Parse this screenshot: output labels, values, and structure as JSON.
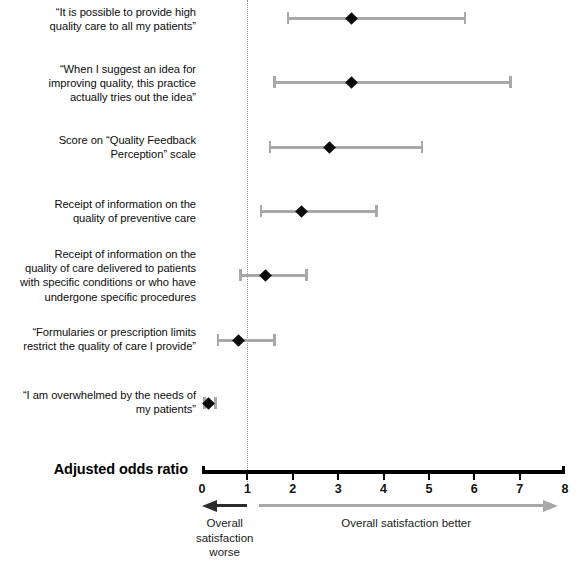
{
  "figure": {
    "width": 578,
    "height": 562,
    "background": "#ffffff",
    "marker_color": "#0a0a0a",
    "interval_color": "#a8a8a8",
    "axis_color": "#000000",
    "null_line_color": "#999999",
    "worse_arrow_color": "#2b2b2b",
    "better_arrow_color": "#a8a8a8"
  },
  "axis": {
    "title": "Adjusted odds ratio",
    "ticks": [
      "0",
      "1",
      "2",
      "3",
      "4",
      "5",
      "6",
      "7",
      "8"
    ],
    "tick_values": [
      0,
      1,
      2,
      3,
      4,
      5,
      6,
      7,
      8
    ],
    "xlim": [
      0,
      8
    ],
    "null_value": 1
  },
  "direction": {
    "worse_label": "Overall\nsatisfaction\nworse",
    "better_label": "Overall satisfaction better"
  },
  "chart_data": {
    "type": "scatter",
    "title": "",
    "subtitle": "",
    "xlabel": "Adjusted odds ratio",
    "ylabel": "",
    "xlim": [
      0,
      8
    ],
    "xticks": [
      0,
      1,
      2,
      3,
      4,
      5,
      6,
      7,
      8
    ],
    "grid": false,
    "legend": "none",
    "reference_line": {
      "x": 1,
      "style": "dotted",
      "label": ""
    },
    "annotations": [
      "Overall satisfaction worse",
      "Overall satisfaction better"
    ],
    "categories": [
      "“It is possible to provide high\nquality care to all my patients”",
      "“When I suggest an idea for\nimproving quality, this practice\nactually tries out the idea”",
      "Score on “Quality Feedback\nPerception” scale",
      "Receipt of information on the\nquality of preventive care",
      "Receipt of information on the\nquality of care delivered to patients\nwith specific conditions or who have\nundergone specific procedures",
      "“Formularies or prescription limits\nrestrict the quality of care I provide”",
      "“I am overwhelmed by the needs of\nmy patients”"
    ],
    "values": [
      3.3,
      3.3,
      2.8,
      2.2,
      1.4,
      0.8,
      0.15
    ],
    "ci_low": [
      1.9,
      1.6,
      1.5,
      1.3,
      0.85,
      0.35,
      0.05
    ],
    "ci_high": [
      5.8,
      6.8,
      4.85,
      3.85,
      2.3,
      1.6,
      0.3
    ],
    "rows": [
      {
        "label": "“It is possible to provide high\nquality care to all my patients”",
        "odds_ratio": 3.3,
        "ci_low": 1.9,
        "ci_high": 5.8,
        "y": 18,
        "label_top": 5
      },
      {
        "label": "“When I suggest an idea for\nimproving quality, this practice\nactually tries out the idea”",
        "odds_ratio": 3.3,
        "ci_low": 1.6,
        "ci_high": 6.8,
        "y": 82,
        "label_top": 62
      },
      {
        "label": "Score on “Quality Feedback\nPerception” scale",
        "odds_ratio": 2.8,
        "ci_low": 1.5,
        "ci_high": 4.85,
        "y": 147,
        "label_top": 133
      },
      {
        "label": "Receipt of information on the\nquality of preventive care",
        "odds_ratio": 2.2,
        "ci_low": 1.3,
        "ci_high": 3.85,
        "y": 211,
        "label_top": 197
      },
      {
        "label": "Receipt of information on the\nquality of care delivered to patients\nwith specific conditions or who have\nundergone specific procedures",
        "odds_ratio": 1.4,
        "ci_low": 0.85,
        "ci_high": 2.3,
        "y": 275,
        "label_top": 247
      },
      {
        "label": "“Formularies or prescription limits\nrestrict the quality of care I provide”",
        "odds_ratio": 0.8,
        "ci_low": 0.35,
        "ci_high": 1.6,
        "y": 340,
        "label_top": 325
      },
      {
        "label": "“I am overwhelmed by the needs of\nmy patients”",
        "odds_ratio": 0.15,
        "ci_low": 0.05,
        "ci_high": 0.3,
        "y": 403,
        "label_top": 388
      }
    ]
  }
}
